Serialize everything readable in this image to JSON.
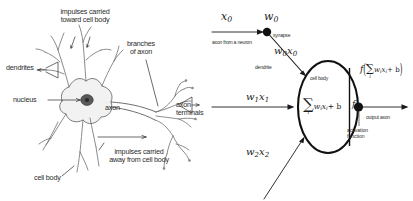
{
  "figure": {
    "background_color": "#ffffff",
    "ink_color": "#2b2b2b",
    "panels": [
      "biological-neuron-diagram",
      "mathematical-neuron-model"
    ]
  },
  "biological": {
    "labels": {
      "impulses_toward_line1": "impulses carried",
      "impulses_toward_line2": "toward cell body",
      "dendrites": "dendrites",
      "nucleus": "nucleus",
      "branches_line1": "branches",
      "branches_line2": "of axon",
      "axon": "axon",
      "axon_terminals_line1": "axon",
      "axon_terminals_line2": "terminals",
      "impulses_away_line1": "impulses carried",
      "impulses_away_line2": "away from cell body",
      "cell_body": "cell body"
    }
  },
  "math": {
    "inputs": [
      {
        "signal": "x0",
        "signal_display": "x",
        "signal_sub": "0",
        "weight_display": "w",
        "weight_sub": "0"
      }
    ],
    "labels": {
      "x0": "x",
      "x0_sub": "0",
      "w0": "w",
      "w0_sub": "0",
      "synapse": "synapse",
      "axon_from_neuron": "axon from a neuron",
      "w0x0_w": "w",
      "w0x0_wsub": "0",
      "w0x0_x": "x",
      "w0x0_xsub": "0",
      "dendrite": "dendrite",
      "w1x1_w": "w",
      "w1x1_wsub": "1",
      "w1x1_x": "x",
      "w1x1_xsub": "1",
      "w2x2_w": "w",
      "w2x2_wsub": "2",
      "w2x2_x": "x",
      "w2x2_xsub": "2",
      "cell_body": "cell body",
      "sum_sigma": "∑",
      "sum_index": "i",
      "sum_body": "w",
      "sum_body_wsub": "i",
      "sum_body_x": "x",
      "sum_body_xsub": "i",
      "sum_plus_b": "+ b",
      "activation_f": "f",
      "output_paren_open": "(",
      "output_paren_close": ")",
      "output_axon": "output axon",
      "activation_line1": "activation",
      "activation_line2": "function"
    }
  }
}
